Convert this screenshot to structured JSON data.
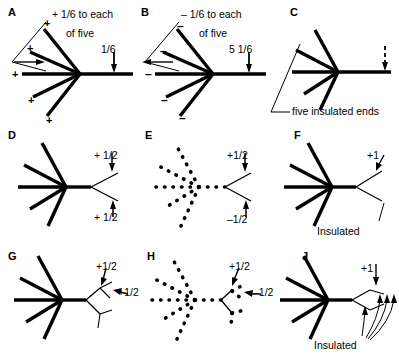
{
  "figure": {
    "rows": 3,
    "cols": 3,
    "stroke_color": "#000000",
    "background": "#ffffff"
  },
  "panels": [
    {
      "id": "A",
      "label": "A",
      "ray_count": 5,
      "ray_style": "solid",
      "tip_marks": [
        "+",
        "+",
        "+",
        "+",
        "+"
      ],
      "captions": [
        {
          "name": "caption-line-1",
          "text": "+ 1/6 to each"
        },
        {
          "name": "caption-line-2",
          "text": "of five"
        },
        {
          "name": "flux-label",
          "text": "1/6"
        }
      ],
      "arrow": "solid-down"
    },
    {
      "id": "B",
      "label": "B",
      "ray_count": 5,
      "ray_style": "solid",
      "tip_marks": [
        "–",
        "–",
        "–",
        "–",
        "–"
      ],
      "captions": [
        {
          "name": "caption-line-1",
          "text": "– 1/6 to each"
        },
        {
          "name": "caption-line-2",
          "text": "of five"
        },
        {
          "name": "flux-label",
          "text": "5 1/6"
        }
      ],
      "arrow": "solid-down"
    },
    {
      "id": "C",
      "label": "C",
      "ray_count": 5,
      "ray_style": "solid",
      "tip_marks": [],
      "captions": [
        {
          "name": "insulated-ends-label",
          "text": "five insulated ends"
        }
      ],
      "arrow": "dashed-down"
    },
    {
      "id": "D",
      "label": "D",
      "ray_count": 5,
      "ray_style": "solid",
      "branch": "fork-2",
      "captions": [
        {
          "name": "upper-branch-label",
          "text": "+ 1/2"
        },
        {
          "name": "lower-branch-label",
          "text": "+ 1/2"
        }
      ]
    },
    {
      "id": "E",
      "label": "E",
      "ray_count": 5,
      "ray_style": "dotted",
      "branch": "fork-2",
      "captions": [
        {
          "name": "upper-branch-label",
          "text": "+1/2"
        },
        {
          "name": "lower-branch-label",
          "text": "–1/2"
        }
      ]
    },
    {
      "id": "F",
      "label": "F",
      "ray_count": 5,
      "ray_style": "solid",
      "branch": "fork-2-thin",
      "captions": [
        {
          "name": "upper-branch-label",
          "text": "+1"
        },
        {
          "name": "insulated-label",
          "text": "Insulated"
        }
      ]
    },
    {
      "id": "G",
      "label": "G",
      "ray_count": 5,
      "ray_style": "solid",
      "branch": "fork-nested",
      "captions": [
        {
          "name": "upper-branch-label",
          "text": "+1/2"
        },
        {
          "name": "inner-branch-label",
          "text": "+1/2"
        }
      ]
    },
    {
      "id": "H",
      "label": "H",
      "ray_count": 5,
      "ray_style": "dotted",
      "branch": "fork-nested-dotted",
      "captions": [
        {
          "name": "upper-branch-label",
          "text": "+1/2"
        },
        {
          "name": "lower-branch-label",
          "text": "–1/2"
        }
      ]
    },
    {
      "id": "J",
      "label": "J",
      "ray_count": 5,
      "ray_style": "solid",
      "branch": "fork-multi-curved",
      "captions": [
        {
          "name": "upper-branch-label",
          "text": "+1"
        },
        {
          "name": "insulated-label",
          "text": "Insulated"
        }
      ]
    }
  ]
}
